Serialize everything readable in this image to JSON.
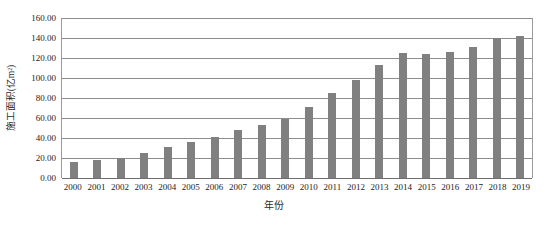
{
  "chart_data": {
    "type": "bar",
    "title": "",
    "xlabel": "年份",
    "ylabel": "施工面积(亿m²)",
    "ylim": [
      0,
      160
    ],
    "ytick_step": 20,
    "ytick_labels": [
      "160.00",
      "140.00",
      "120.00",
      "100.00",
      "80.00",
      "60.00",
      "40.00",
      "20.00",
      "0.00"
    ],
    "ytick_values": [
      160,
      140,
      120,
      100,
      80,
      60,
      40,
      20,
      0
    ],
    "grid": true,
    "legend": "none",
    "bar_color": "#808080",
    "gridline_color": "#8d8d8d",
    "axis_color": "#9a9a9a",
    "categories": [
      "2000",
      "2001",
      "2002",
      "2003",
      "2004",
      "2005",
      "2006",
      "2007",
      "2008",
      "2009",
      "2010",
      "2011",
      "2012",
      "2013",
      "2014",
      "2015",
      "2016",
      "2017",
      "2018",
      "2019"
    ],
    "values": [
      16,
      18,
      20,
      25,
      31,
      36,
      41,
      48,
      53,
      59,
      71,
      85,
      98,
      113,
      125,
      124,
      126,
      131,
      140,
      142
    ]
  }
}
